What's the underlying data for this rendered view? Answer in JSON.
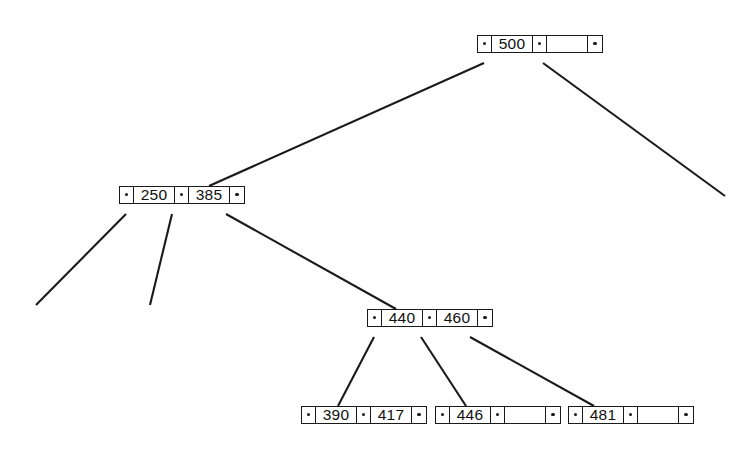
{
  "diagram": {
    "type": "b-tree",
    "canvas": {
      "width": 755,
      "height": 464
    },
    "style": {
      "line_color": "#1a1a1a",
      "node_fill": "#ffffff",
      "background": "#ffffff",
      "text_color": "#101010"
    },
    "nodes": [
      {
        "id": "root",
        "name": "root-node",
        "level": 0,
        "x": 477,
        "y": 35,
        "cells": [
          {
            "kind": "pointer",
            "label": "·"
          },
          {
            "kind": "key",
            "label": "500"
          },
          {
            "kind": "pointer",
            "label": "·"
          },
          {
            "kind": "key",
            "label": ""
          },
          {
            "kind": "pointer",
            "label": "·"
          }
        ]
      },
      {
        "id": "internal-250-385",
        "name": "internal-node-250-385",
        "level": 1,
        "x": 119,
        "y": 186,
        "cells": [
          {
            "kind": "pointer",
            "label": "·"
          },
          {
            "kind": "key",
            "label": "250"
          },
          {
            "kind": "pointer",
            "label": "·"
          },
          {
            "kind": "key",
            "label": "385"
          },
          {
            "kind": "pointer",
            "label": "·"
          }
        ]
      },
      {
        "id": "internal-440-460",
        "name": "internal-node-440-460",
        "level": 2,
        "x": 367,
        "y": 309,
        "cells": [
          {
            "kind": "pointer",
            "label": "·"
          },
          {
            "kind": "key",
            "label": "440"
          },
          {
            "kind": "pointer",
            "label": "·"
          },
          {
            "kind": "key",
            "label": "460"
          },
          {
            "kind": "pointer",
            "label": "·"
          }
        ]
      },
      {
        "id": "leaf-390-417",
        "name": "leaf-node-390-417",
        "level": 3,
        "x": 301,
        "y": 406,
        "cells": [
          {
            "kind": "pointer",
            "label": "·"
          },
          {
            "kind": "key",
            "label": "390"
          },
          {
            "kind": "pointer",
            "label": "·"
          },
          {
            "kind": "key",
            "label": "417"
          },
          {
            "kind": "pointer",
            "label": "·"
          }
        ]
      },
      {
        "id": "leaf-446",
        "name": "leaf-node-446",
        "level": 3,
        "x": 435,
        "y": 406,
        "cells": [
          {
            "kind": "pointer",
            "label": "·"
          },
          {
            "kind": "key",
            "label": "446"
          },
          {
            "kind": "pointer",
            "label": "·"
          },
          {
            "kind": "key",
            "label": ""
          },
          {
            "kind": "pointer",
            "label": "·"
          }
        ]
      },
      {
        "id": "leaf-481",
        "name": "leaf-node-481",
        "level": 3,
        "x": 568,
        "y": 406,
        "cells": [
          {
            "kind": "pointer",
            "label": "·"
          },
          {
            "kind": "key",
            "label": "481"
          },
          {
            "kind": "pointer",
            "label": "·"
          },
          {
            "kind": "key",
            "label": ""
          },
          {
            "kind": "pointer",
            "label": "·"
          }
        ]
      }
    ],
    "edges": [
      {
        "id": "e-root-left",
        "name": "edge-root-to-250-385",
        "from": "root",
        "to": "internal-250-385",
        "x1": 484,
        "y1": 63,
        "x2": 209,
        "y2": 186,
        "dangling": false
      },
      {
        "id": "e-root-mid",
        "name": "edge-root-right-dangling",
        "from": "root",
        "to": null,
        "x1": 543,
        "y1": 63,
        "x2": 725,
        "y2": 196,
        "dangling": true
      },
      {
        "id": "e-250-left",
        "name": "edge-250-385-left-dangling",
        "from": "internal-250-385",
        "to": null,
        "x1": 126,
        "y1": 214,
        "x2": 36,
        "y2": 305,
        "dangling": true
      },
      {
        "id": "e-250-mid",
        "name": "edge-250-385-middle-dangling",
        "from": "internal-250-385",
        "to": null,
        "x1": 172,
        "y1": 214,
        "x2": 150,
        "y2": 305,
        "dangling": true
      },
      {
        "id": "e-250-right",
        "name": "edge-250-385-to-440-460",
        "from": "internal-250-385",
        "to": "internal-440-460",
        "x1": 226,
        "y1": 214,
        "x2": 396,
        "y2": 309,
        "dangling": false
      },
      {
        "id": "e-440-left",
        "name": "edge-440-460-to-390-417",
        "from": "internal-440-460",
        "to": "leaf-390-417",
        "x1": 374,
        "y1": 337,
        "x2": 338,
        "y2": 406,
        "dangling": false
      },
      {
        "id": "e-440-mid",
        "name": "edge-440-460-to-446",
        "from": "internal-440-460",
        "to": "leaf-446",
        "x1": 421,
        "y1": 337,
        "x2": 466,
        "y2": 406,
        "dangling": false
      },
      {
        "id": "e-440-right",
        "name": "edge-440-460-to-481",
        "from": "internal-440-460",
        "to": "leaf-481",
        "x1": 470,
        "y1": 337,
        "x2": 594,
        "y2": 406,
        "dangling": false
      }
    ]
  }
}
